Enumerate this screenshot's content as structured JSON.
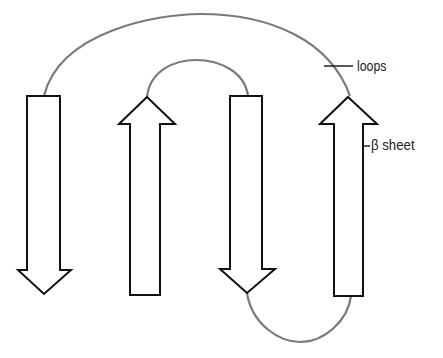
{
  "diagram": {
    "labels": {
      "loops": "loops",
      "beta_sheet": "β sheet"
    },
    "strands": [
      {
        "id": 1,
        "direction": "down"
      },
      {
        "id": 2,
        "direction": "up"
      },
      {
        "id": 3,
        "direction": "down"
      },
      {
        "id": 4,
        "direction": "up"
      }
    ],
    "loops": [
      {
        "from_strand": 1,
        "to_strand": 4,
        "position": "top",
        "size": "large"
      },
      {
        "from_strand": 2,
        "to_strand": 3,
        "position": "top",
        "size": "small"
      },
      {
        "from_strand": 3,
        "to_strand": 4,
        "position": "bottom",
        "size": "small"
      }
    ],
    "colors": {
      "strand_outline": "#111111",
      "loop": "#7a7a7a",
      "background": "#ffffff"
    }
  }
}
